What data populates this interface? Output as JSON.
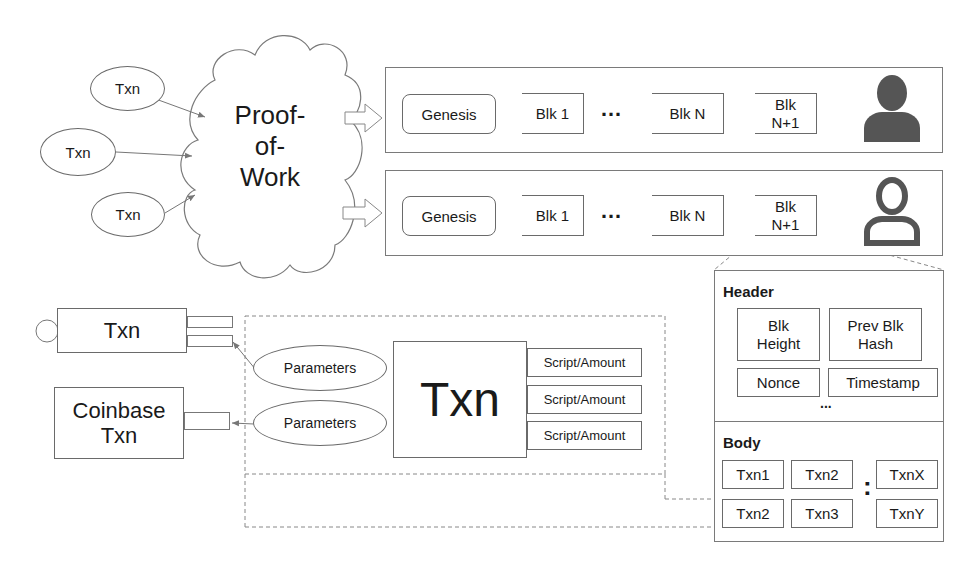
{
  "mining": {
    "inputs": [
      {
        "label": "Txn"
      },
      {
        "label": "Txn"
      },
      {
        "label": "Txn"
      }
    ],
    "cloud_label": "Proof-\nof-\nWork",
    "cloud_lines": [
      "Proof-",
      "of-",
      "Work"
    ]
  },
  "chains": [
    {
      "blocks": [
        {
          "label": "Genesis"
        },
        {
          "label": "Blk 1"
        },
        {
          "label": "Blk N"
        },
        {
          "label": "Blk\nN+1",
          "lines": [
            "Blk",
            "N+1"
          ]
        }
      ],
      "ellipsis": "…",
      "user_icon": "user-filled-icon"
    },
    {
      "blocks": [
        {
          "label": "Genesis"
        },
        {
          "label": "Blk 1"
        },
        {
          "label": "Blk N"
        },
        {
          "label": "Blk\nN+1",
          "lines": [
            "Blk",
            "N+1"
          ]
        }
      ],
      "ellipsis": "…",
      "user_icon": "user-outline-icon"
    }
  ],
  "block_detail": {
    "header": {
      "title": "Header",
      "fields": [
        {
          "lines": [
            "Blk",
            "Height"
          ]
        },
        {
          "lines": [
            "Prev Blk",
            "Hash"
          ]
        },
        {
          "lines": [
            "Nonce"
          ]
        },
        {
          "lines": [
            "Timestamp"
          ]
        }
      ],
      "more": "..."
    },
    "body": {
      "title": "Body",
      "txns": [
        "Txn1",
        "Txn2",
        "Txn2",
        "Txn3",
        "TxnX",
        "TxnY"
      ],
      "more": ":"
    }
  },
  "transaction": {
    "prev_txn": {
      "label": "Txn"
    },
    "coinbase_txn": {
      "lines": [
        "Coinbase",
        "Txn"
      ]
    },
    "inputs": [
      {
        "label": "Parameters"
      },
      {
        "label": "Parameters"
      }
    ],
    "main_label": "Txn",
    "outputs": [
      {
        "label": "Script/Amount"
      },
      {
        "label": "Script/Amount"
      },
      {
        "label": "Script/Amount"
      }
    ]
  }
}
